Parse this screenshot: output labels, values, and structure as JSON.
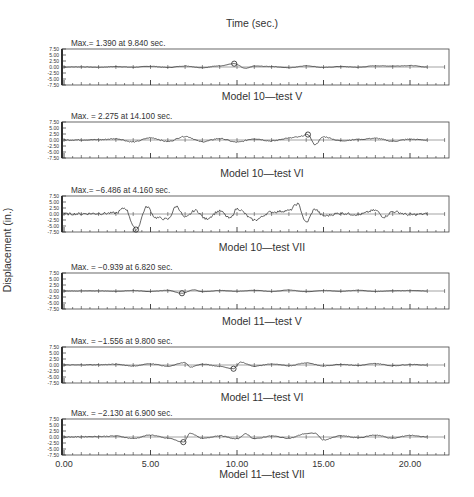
{
  "chart_data": [
    {
      "type": "line",
      "title": "Model 10—test V",
      "max_annotation": "Max.= 1.390 at 9.840 sec.",
      "max_value": 1.39,
      "max_time": 9.84,
      "xlabel": "Time (sec.)",
      "ylabel": "Displacement (in.)",
      "xlim": [
        0,
        22
      ],
      "ylim": [
        -7.5,
        7.5
      ],
      "yticks": [
        "7.50",
        "5.00",
        "2.50",
        "0.00",
        "-2.50",
        "-5.00",
        "-7.50"
      ],
      "amplitude": 0.5,
      "duration": 21.0,
      "series": [
        {
          "name": "displacement",
          "x": [
            0,
            1,
            2,
            3,
            4,
            5,
            6,
            7,
            8,
            9,
            9.84,
            10.5,
            11,
            12,
            13,
            14,
            15,
            16,
            17,
            18,
            19,
            20,
            21
          ],
          "y": [
            0,
            0.05,
            -0.1,
            0.15,
            -0.1,
            0.3,
            -0.2,
            0.4,
            -0.3,
            0.5,
            1.39,
            -0.6,
            0.4,
            0.2,
            -0.3,
            0.5,
            -0.2,
            0.2,
            -0.1,
            0.5,
            0.4,
            0.6,
            0
          ]
        }
      ]
    },
    {
      "type": "line",
      "title": "Model 10—test VI",
      "max_annotation": "Max. = 2.275 at 14.100 sec.",
      "max_value": 2.275,
      "max_time": 14.1,
      "xlim": [
        0,
        22
      ],
      "ylim": [
        -7.5,
        7.5
      ],
      "yticks": [
        "7.50",
        "5.00",
        "2.50",
        "0.00",
        "-2.50",
        "-5.00",
        "-7.50"
      ],
      "amplitude": 1.2,
      "duration": 21.0,
      "series": [
        {
          "name": "displacement",
          "x": [
            0,
            2,
            3,
            4,
            5,
            6,
            7,
            8,
            9,
            10,
            11,
            12,
            13,
            13.5,
            14.1,
            14.5,
            15,
            16,
            17,
            18,
            19,
            20,
            21
          ],
          "y": [
            0,
            0.1,
            0.5,
            -0.8,
            0.9,
            -0.6,
            1.5,
            -0.7,
            0.6,
            -0.9,
            0.5,
            -0.4,
            0.8,
            1.2,
            2.275,
            -1.9,
            1.3,
            -0.3,
            0.2,
            0.7,
            -0.5,
            0.3,
            0
          ]
        }
      ]
    },
    {
      "type": "line",
      "title": "Model 10—test VII",
      "max_annotation": "Max.= −6.486 at 4.160 sec.",
      "max_value": -6.486,
      "max_time": 4.16,
      "xlim": [
        0,
        22
      ],
      "ylim": [
        -7.5,
        7.5
      ],
      "yticks": [
        "7.50",
        "5.00",
        "2.50",
        "0.00",
        "-2.50",
        "-5.00",
        "-7.50"
      ],
      "amplitude": 3.0,
      "duration": 21.0,
      "series": [
        {
          "name": "displacement",
          "x": [
            0,
            2,
            3,
            3.5,
            4.16,
            4.8,
            5.3,
            6,
            6.5,
            7,
            7.6,
            8.2,
            9,
            9.6,
            10,
            11,
            12,
            13,
            13.5,
            14,
            14.5,
            15,
            16,
            17,
            18,
            18.5,
            19,
            20,
            21
          ],
          "y": [
            0,
            0.2,
            0.4,
            2.5,
            -6.486,
            3.0,
            -1.5,
            -2.2,
            3.2,
            -1.5,
            1.5,
            -2.0,
            1.2,
            -1.8,
            2.2,
            -2.5,
            0.8,
            1.4,
            4.2,
            -3.5,
            2.0,
            -0.8,
            0.3,
            -0.2,
            1.5,
            -1.2,
            1.0,
            -0.3,
            0
          ]
        }
      ]
    },
    {
      "type": "line",
      "title": "Model 11—test V",
      "max_annotation": "Max. = −0.939 at 6.820 sec.",
      "max_value": -0.939,
      "max_time": 6.82,
      "xlim": [
        0,
        22
      ],
      "ylim": [
        -7.5,
        7.5
      ],
      "yticks": [
        "7.50",
        "5.00",
        "2.50",
        "0.00",
        "-2.50",
        "-5.00",
        "-7.50"
      ],
      "amplitude": 0.35,
      "duration": 21.0,
      "series": [
        {
          "name": "displacement",
          "x": [
            0,
            2,
            3,
            4,
            5,
            6,
            6.82,
            7.5,
            8,
            9,
            10,
            11,
            12,
            13,
            14,
            15,
            16,
            17,
            18,
            19,
            20,
            21
          ],
          "y": [
            0,
            0.05,
            -0.1,
            0.2,
            -0.2,
            0.3,
            -0.939,
            0.5,
            -0.3,
            0.2,
            -0.1,
            0.3,
            -0.2,
            0.4,
            -0.3,
            0.2,
            -0.1,
            0.3,
            -0.2,
            0.1,
            0.2,
            0
          ]
        }
      ]
    },
    {
      "type": "line",
      "title": "Model 11—test VI",
      "max_annotation": "Max. = −1.556 at 9.800 sec.",
      "max_value": -1.556,
      "max_time": 9.8,
      "xlim": [
        0,
        22
      ],
      "ylim": [
        -7.5,
        7.5
      ],
      "yticks": [
        "7.50",
        "5.00",
        "2.50",
        "0.00",
        "-2.50",
        "-5.00",
        "-7.50"
      ],
      "amplitude": 0.7,
      "duration": 21.0,
      "series": [
        {
          "name": "displacement",
          "x": [
            0,
            2,
            3,
            4,
            5,
            6,
            7,
            7.3,
            8,
            9,
            9.8,
            10.2,
            11,
            12,
            13,
            14,
            15,
            16,
            17,
            18,
            19,
            20,
            21
          ],
          "y": [
            0,
            0.1,
            0.3,
            -0.4,
            0.5,
            -0.5,
            1.0,
            -0.9,
            0.4,
            -0.6,
            -1.556,
            1.2,
            -0.5,
            0.4,
            -0.3,
            0.9,
            -0.4,
            0.3,
            -0.2,
            0.6,
            -0.3,
            0.2,
            0
          ]
        }
      ]
    },
    {
      "type": "line",
      "title": "Model 11—test VII",
      "max_annotation": "Max. = −2.130 at 6.900 sec.",
      "max_value": -2.13,
      "max_time": 6.9,
      "xlim": [
        0,
        22
      ],
      "ylim": [
        -7.5,
        7.5
      ],
      "xticks": [
        "0.00",
        "5.00",
        "10.00",
        "15.00",
        "20.00"
      ],
      "yticks": [
        "7.50",
        "5.00",
        "2.50",
        "0.00",
        "-2.50",
        "-5.00",
        "-7.50"
      ],
      "amplitude": 0.9,
      "duration": 21.0,
      "series": [
        {
          "name": "displacement",
          "x": [
            0,
            2,
            3,
            4,
            5,
            6,
            6.9,
            7.3,
            8,
            9,
            10,
            10.5,
            11,
            12,
            13,
            14,
            14.5,
            15,
            16,
            17,
            18,
            19,
            20,
            21
          ],
          "y": [
            0,
            0.2,
            0.4,
            -0.6,
            0.8,
            -0.5,
            -2.13,
            1.6,
            -0.6,
            0.5,
            -0.8,
            1.3,
            -0.7,
            0.4,
            -0.5,
            1.4,
            1.6,
            -1.2,
            0.5,
            -0.3,
            0.8,
            -0.5,
            0.7,
            0
          ]
        }
      ]
    }
  ],
  "figure": {
    "xlabel_top": "Time (sec.)",
    "ylabel": "Displacement (in.)"
  }
}
